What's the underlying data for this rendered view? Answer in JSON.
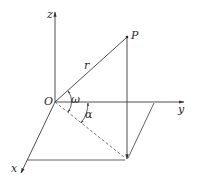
{
  "diagram": {
    "type": "3d-coordinate-vector",
    "labels": {
      "z_axis": "z",
      "y_axis": "y",
      "x_axis": "x",
      "origin": "O",
      "point": "P",
      "radius": "r",
      "elevation_angle": "ω",
      "azimuth_angle": "α"
    },
    "colors": {
      "stroke": "#3a3a3a",
      "background": "#ffffff"
    }
  }
}
